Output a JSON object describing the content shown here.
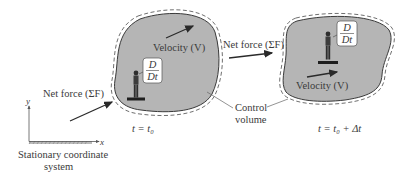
{
  "diagram": {
    "colors": {
      "cv_fill": "#b5b5b5",
      "outline": "#4a4a4a",
      "arrow": "#2a2a2a",
      "text": "#3a3a3a",
      "background": "#ffffff"
    },
    "left_cv": {
      "velocity_label": "Velocity (V)",
      "operator_num": "D",
      "operator_den": "Dt",
      "time_label": "t = t₀"
    },
    "right_cv": {
      "velocity_label": "Velocity (V)",
      "operator_num": "D",
      "operator_den": "Dt",
      "time_label": "t = t₀ + Δt"
    },
    "net_force_left": "Net force (ΣF)",
    "net_force_right": "Net force (ΣF)",
    "control_volume_line1": "Control",
    "control_volume_line2": "volume",
    "axes": {
      "x_label": "x",
      "y_label": "y",
      "caption_line1": "Stationary coordinate",
      "caption_line2": "system"
    }
  }
}
